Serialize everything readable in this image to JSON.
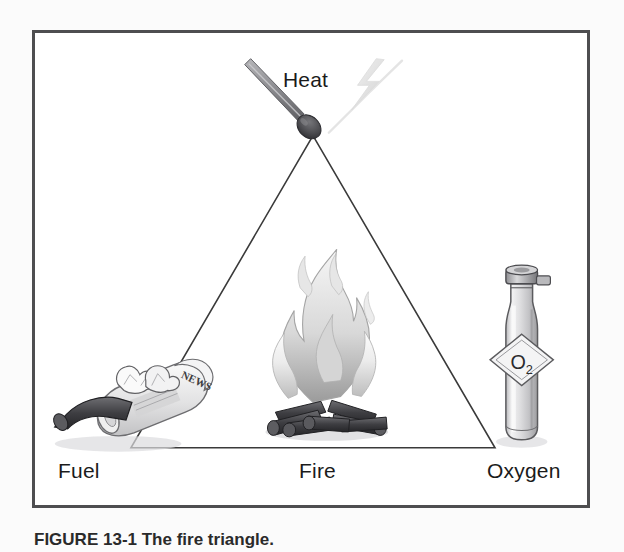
{
  "figure": {
    "caption_label": "FIGURE",
    "caption_number": "13-1",
    "caption_text": "The fire triangle."
  },
  "diagram": {
    "title_alt": "Fire triangle diagram",
    "vertices": [
      {
        "id": "heat",
        "label": "Heat",
        "icon": "lit-match-icon",
        "position": "apex"
      },
      {
        "id": "fuel",
        "label": "Fuel",
        "icon": "newspaper-log-icon",
        "position": "bottom-left"
      },
      {
        "id": "oxygen",
        "label": "Oxygen",
        "icon": "oxygen-cylinder-icon",
        "position": "bottom-right"
      }
    ],
    "center": {
      "id": "fire",
      "label": "Fire",
      "icon": "campfire-icon"
    },
    "spark_icon": "lightning-bolt-icon",
    "cylinder_label": "O",
    "cylinder_label_sub": "2",
    "newspaper_text": "NEWS"
  },
  "colors": {
    "frame_border": "#4e4e50",
    "page_background": "#fbfbfb",
    "panel_background": "#ffffff",
    "triangle_stroke": "#3a3a3a",
    "text": "#1b1b1b",
    "flame_light": "#ededed",
    "flame_mid": "#c9c9c9",
    "flame_dark": "#9a9a9a",
    "log_dark": "#4a4a4c",
    "log_mid": "#6d6d70",
    "match_stick": "#8c8c8f",
    "match_head": "#4b4b4e",
    "spark_gray": "#e0e0e0",
    "bottle_light": "#e8e8e8",
    "bottle_mid": "#c4c4c4"
  }
}
